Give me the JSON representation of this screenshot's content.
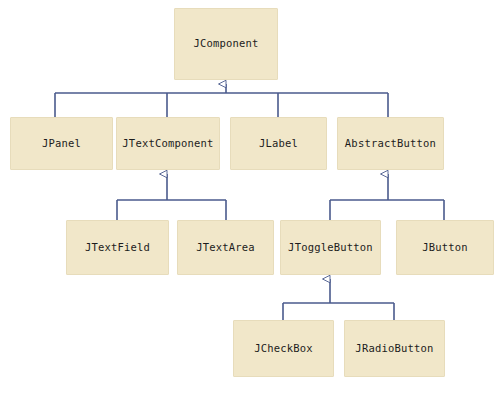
{
  "diagram": {
    "type": "uml-class-hierarchy",
    "canvas": {
      "width": 500,
      "height": 398
    },
    "colors": {
      "background": "#ffffff",
      "node_fill": "#f1e7c9",
      "node_border": "#e7dcbb",
      "edge": "#4a5a8c",
      "text": "#1c1c1c"
    },
    "nodes": [
      {
        "id": "jcomponent",
        "label": "JComponent",
        "x": 174,
        "y": 8,
        "w": 104,
        "h": 72
      },
      {
        "id": "jpanel",
        "label": "JPanel",
        "x": 10,
        "y": 117,
        "w": 103,
        "h": 53
      },
      {
        "id": "jtextcomponent",
        "label": "JTextComponent",
        "x": 116,
        "y": 117,
        "w": 104,
        "h": 53
      },
      {
        "id": "jlabel",
        "label": "JLabel",
        "x": 230,
        "y": 117,
        "w": 97,
        "h": 53
      },
      {
        "id": "abstractbutton",
        "label": "AbstractButton",
        "x": 337,
        "y": 117,
        "w": 107,
        "h": 53
      },
      {
        "id": "jtextfield",
        "label": "JTextField",
        "x": 66,
        "y": 220,
        "w": 103,
        "h": 55
      },
      {
        "id": "jtextarea",
        "label": "JTextArea",
        "x": 177,
        "y": 220,
        "w": 97,
        "h": 55
      },
      {
        "id": "jtogglebutton",
        "label": "JToggleButton",
        "x": 280,
        "y": 220,
        "w": 101,
        "h": 55
      },
      {
        "id": "jbutton",
        "label": "JButton",
        "x": 396,
        "y": 220,
        "w": 98,
        "h": 55
      },
      {
        "id": "jcheckbox",
        "label": "JCheckBox",
        "x": 233,
        "y": 320,
        "w": 101,
        "h": 57
      },
      {
        "id": "jradiobutton",
        "label": "JRadioButton",
        "x": 344,
        "y": 320,
        "w": 101,
        "h": 57
      }
    ],
    "edges": [
      {
        "id": "e-jcomponent-children",
        "parent": "JComponent",
        "children": [
          "JPanel",
          "JTextComponent",
          "JLabel",
          "AbstractButton"
        ],
        "relation": "generalization"
      },
      {
        "id": "e-jtextcomponent-children",
        "parent": "JTextComponent",
        "children": [
          "JTextField",
          "JTextArea"
        ],
        "relation": "generalization"
      },
      {
        "id": "e-abstractbutton-children",
        "parent": "AbstractButton",
        "children": [
          "JToggleButton",
          "JButton"
        ],
        "relation": "generalization"
      },
      {
        "id": "e-jtogglebutton-children",
        "parent": "JToggleButton",
        "children": [
          "JCheckBox",
          "JRadioButton"
        ],
        "relation": "generalization"
      }
    ]
  }
}
